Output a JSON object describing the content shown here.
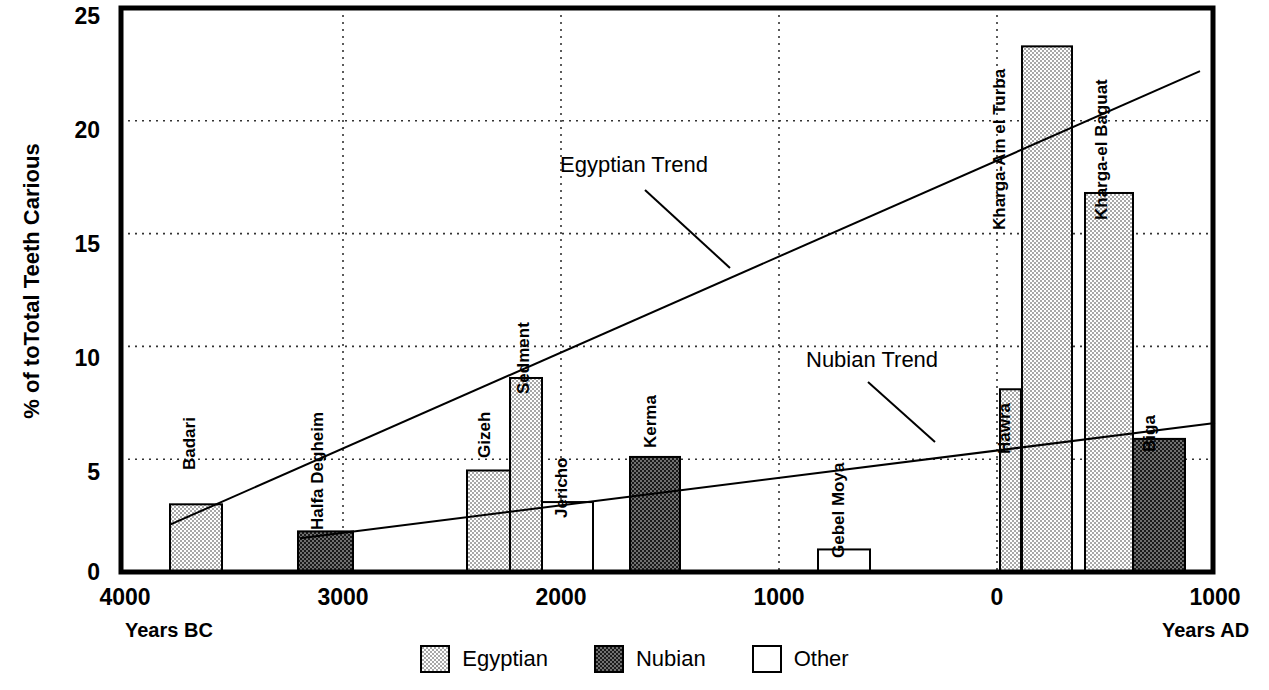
{
  "chart_data": {
    "type": "bar",
    "title": "",
    "xlabel_left": "Years BC",
    "xlabel_right": "Years AD",
    "ylabel": "% of toTotal Teeth Carious",
    "ylim": [
      0,
      25
    ],
    "yticks": [
      0,
      5,
      10,
      15,
      20,
      25
    ],
    "xticks": [
      {
        "label": "4000",
        "year": -4000
      },
      {
        "label": "3000",
        "year": -3000
      },
      {
        "label": "2000",
        "year": -2000
      },
      {
        "label": "1000",
        "year": -1000
      },
      {
        "label": "0",
        "year": 0
      },
      {
        "label": "1000",
        "year": 1000
      }
    ],
    "xlim": [
      -4000,
      1000
    ],
    "grid": "dotted",
    "legend": [
      {
        "key": "egyptian",
        "label": "Egyptian",
        "fill": "light-stipple",
        "color": "#d9d9d9"
      },
      {
        "key": "nubian",
        "label": "Nubian",
        "fill": "dark-checker",
        "color": "#4a4a4a"
      },
      {
        "key": "other",
        "label": "Other",
        "fill": "white",
        "color": "#ffffff"
      }
    ],
    "categories": [
      "Badari",
      "Halfa Degheim",
      "Gizeh",
      "Sedment",
      "Jericho",
      "Kerma",
      "Gebel Moya",
      "Hawra",
      "Kharga-Ain el Turba",
      "Kharga-el Baguat",
      "Biga"
    ],
    "values": [
      3.0,
      1.8,
      4.5,
      8.6,
      3.1,
      5.1,
      1.0,
      8.1,
      23.3,
      16.8,
      5.9
    ],
    "bars": [
      {
        "name": "Badari",
        "value": 3.0,
        "group": "egyptian",
        "x0": 170,
        "x1": 222
      },
      {
        "name": "Halfa Degheim",
        "value": 1.8,
        "group": "nubian",
        "x0": 298,
        "x1": 353
      },
      {
        "name": "Gizeh",
        "value": 4.5,
        "group": "egyptian",
        "x0": 467,
        "x1": 510
      },
      {
        "name": "Sedment",
        "value": 8.6,
        "group": "egyptian",
        "x0": 510,
        "x1": 542
      },
      {
        "name": "Jericho",
        "value": 3.1,
        "group": "other",
        "x0": 542,
        "x1": 593
      },
      {
        "name": "Kerma",
        "value": 5.1,
        "group": "nubian",
        "x0": 630,
        "x1": 680
      },
      {
        "name": "Gebel Moya",
        "value": 1.0,
        "group": "other",
        "x0": 818,
        "x1": 870
      },
      {
        "name": "Hawra",
        "value": 8.1,
        "group": "egyptian",
        "x0": 1000,
        "x1": 1021
      },
      {
        "name": "Kharga-Ain el Turba",
        "value": 23.3,
        "group": "egyptian",
        "x0": 1022,
        "x1": 1072
      },
      {
        "name": "Kharga-el Baguat",
        "value": 16.8,
        "group": "egyptian",
        "x0": 1085,
        "x1": 1133
      },
      {
        "name": "Biga",
        "value": 5.9,
        "group": "nubian",
        "x0": 1133,
        "x1": 1185
      }
    ],
    "trends": [
      {
        "name": "Egyptian Trend",
        "label": "Egyptian Trend",
        "x0": 170,
        "y0": 2.1,
        "x1": 1200,
        "y1": 22.2,
        "label_x": 560,
        "label_y": 152,
        "leader": {
          "x0": 645,
          "y0": 190,
          "x1": 730,
          "y1": 268
        }
      },
      {
        "name": "Nubian Trend",
        "label": "Nubian Trend",
        "x0": 300,
        "y0": 1.5,
        "x1": 1215,
        "y1": 6.6,
        "label_x": 806,
        "label_y": 347,
        "leader": {
          "x0": 868,
          "y0": 382,
          "x1": 935,
          "y1": 442
        }
      }
    ],
    "bar_labels": [
      {
        "text": "Badari",
        "x": 200,
        "y_bottom": 450
      },
      {
        "text": "Halfa Degheim",
        "x": 328,
        "y_bottom": 510
      },
      {
        "text": "Gizeh",
        "x": 495,
        "y_bottom": 438
      },
      {
        "text": "Sedment",
        "x": 534,
        "y_bottom": 374
      },
      {
        "text": "Jericho",
        "x": 572,
        "y_bottom": 498
      },
      {
        "text": "Kerma",
        "x": 661,
        "y_bottom": 428
      },
      {
        "text": "Gebel Moya",
        "x": 849,
        "y_bottom": 538
      },
      {
        "text": "Hawra",
        "x": 1015,
        "y_bottom": 434
      },
      {
        "text": "Kharga-Ain el Turba",
        "x": 1010,
        "y_bottom": 210
      },
      {
        "text": "Kharga-el Baguat",
        "x": 1112,
        "y_bottom": 200
      },
      {
        "text": "Biga",
        "x": 1160,
        "y_bottom": 432
      }
    ]
  }
}
